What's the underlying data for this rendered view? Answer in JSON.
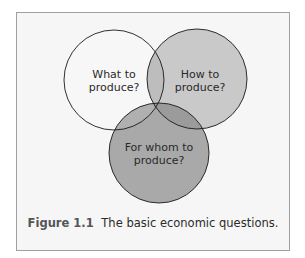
{
  "diagram": {
    "type": "venn",
    "circles": [
      {
        "id": "what",
        "label_line1": "What to",
        "label_line2": "produce?",
        "fill": "#f7f7f7"
      },
      {
        "id": "how",
        "label_line1": "How to",
        "label_line2": "produce?",
        "fill": "#c9c9c9"
      },
      {
        "id": "whom",
        "label_line1": "For whom to",
        "label_line2": "produce?",
        "fill": "#a9a9a9"
      }
    ],
    "outline_color": "#1a1a1a"
  },
  "caption": {
    "figure_label": "Figure 1.1",
    "text": "The basic economic questions."
  },
  "colors": {
    "frame_bg": "#f6f6f6",
    "frame_border": "#a0a0a0",
    "overlap_what_how": "#bdbdbd",
    "overlap_how_whom": "#9b9b9b",
    "overlap_what_whom": "#b0b0b0",
    "overlap_all": "#959595"
  }
}
